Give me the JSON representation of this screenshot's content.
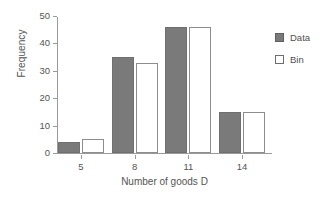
{
  "chart_data": {
    "type": "bar",
    "title": "",
    "subtitle": "",
    "xlabel": "Number of goods D",
    "ylabel": "Frequency",
    "categories": [
      "5",
      "8",
      "11",
      "14"
    ],
    "series": [
      {
        "name": "Data",
        "values": [
          4,
          35,
          46,
          15
        ],
        "color": "#7a7a7a",
        "style": "filled"
      },
      {
        "name": "Bin",
        "values": [
          5,
          33,
          46,
          15
        ],
        "color": "#ffffff",
        "style": "outlined"
      }
    ],
    "ylim": [
      0,
      50
    ],
    "yticks": [
      0,
      10,
      20,
      30,
      40,
      50
    ],
    "ytick_labels": [
      "0",
      "10",
      "20",
      "30",
      "40",
      "50"
    ],
    "xtick_labels": [
      "5",
      "8",
      "11",
      "14"
    ],
    "grid": false,
    "legend_position": "right",
    "legend_entries": [
      "Data",
      "Bin"
    ]
  },
  "colors": {
    "data_fill": "#7a7a7a",
    "data_edge": "#6f6f6f",
    "bin_fill": "#ffffff",
    "bin_edge": "#8d8d8d",
    "axis": "#9a9a9a",
    "text": "#545454",
    "background": "#ffffff"
  }
}
